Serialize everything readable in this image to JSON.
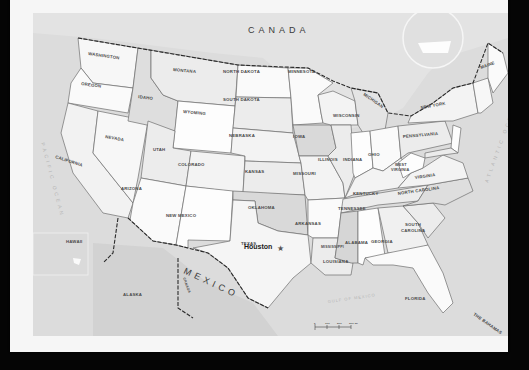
{
  "map": {
    "countries": {
      "canada": "CANADA",
      "mexico": "MEXICO",
      "cuba": "CUBA",
      "bahamas": "THE BAHAMAS"
    },
    "water": {
      "pacific": "PACIFIC OCEAN",
      "atlantic": "ATLANTIC OCEAN",
      "gulf": "GULF OF MEXICO"
    },
    "insets": {
      "hawaii": "HAWAII",
      "alaska": "ALASKA",
      "canada_inset": "CANADA"
    },
    "city": {
      "name": "Houston",
      "marker": "star-icon"
    },
    "states": {
      "washington": "WASHINGTON",
      "oregon": "OREGON",
      "california": "CALIFORNIA",
      "nevada": "NEVADA",
      "idaho": "IDAHO",
      "montana": "MONTANA",
      "wyoming": "WYOMING",
      "utah": "UTAH",
      "arizona": "ARIZONA",
      "colorado": "COLORADO",
      "new_mexico": "NEW MEXICO",
      "north_dakota": "NORTH DAKOTA",
      "south_dakota": "SOUTH DAKOTA",
      "nebraska": "NEBRASKA",
      "kansas": "KANSAS",
      "oklahoma": "OKLAHOMA",
      "texas": "TEXAS",
      "minnesota": "MINNESOTA",
      "iowa": "IOWA",
      "missouri": "MISSOURI",
      "arkansas": "ARKANSAS",
      "louisiana": "LOUISIANA",
      "wisconsin": "WISCONSIN",
      "illinois": "ILLINOIS",
      "michigan": "MICHIGAN",
      "indiana": "INDIANA",
      "ohio": "OHIO",
      "kentucky": "KENTUCKY",
      "tennessee": "TENNESSEE",
      "mississippi": "MISSISSIPPI",
      "alabama": "ALABAMA",
      "georgia": "GEORGIA",
      "florida": "FLORIDA",
      "south_carolina_1": "SOUTH",
      "south_carolina_2": "CAROLINA",
      "north_carolina": "NORTH CAROLINA",
      "virginia": "VIRGINIA",
      "west_virginia_1": "WEST",
      "west_virginia_2": "VIRGINIA",
      "pennsylvania": "PENNSYLVANIA",
      "new_york": "NEW YORK",
      "maine": "MAINE"
    },
    "scale_bar": {
      "ticks": [
        "0",
        "100",
        "200",
        "300 mi"
      ]
    },
    "colors": {
      "background": "#050505",
      "paper": "#f6f6f6",
      "water": "#dcdcdc",
      "state_light": "#fafafa",
      "state_mid": "#ececec",
      "state_dark": "#d6d6d6"
    }
  }
}
